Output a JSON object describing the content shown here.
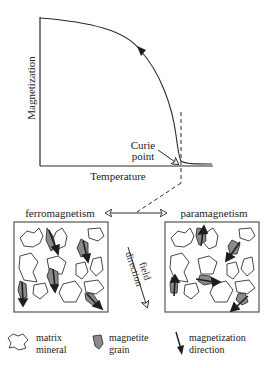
{
  "graph": {
    "y_axis_label": "Magnetization",
    "x_axis_label": "Temperature",
    "curie_label_line1": "Curie",
    "curie_label_line2": "point"
  },
  "states": {
    "left_label": "ferromagnetism",
    "right_label": "paramagnetism",
    "field_label_line1": "field",
    "field_label_line2": "direction"
  },
  "legend": {
    "items": [
      {
        "icon": "matrix-mineral-icon",
        "line1": "matrix",
        "line2": "mineral"
      },
      {
        "icon": "magnetite-grain-icon",
        "line1": "magnetite",
        "line2": "grain"
      },
      {
        "icon": "magnetization-arrow-icon",
        "line1": "magnetization",
        "line2": "direction"
      }
    ]
  },
  "colors": {
    "line": "#2a2a2a",
    "grain_fill": "#8a8a8a",
    "arrow_fill": "#1e1e1e"
  }
}
